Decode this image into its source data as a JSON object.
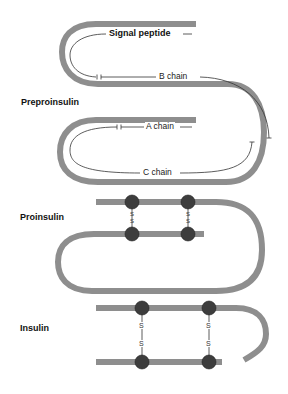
{
  "diagram": {
    "colors": {
      "chain": "#8c8c8c",
      "residue": "#3a3a3a",
      "annotation_line": "#333333",
      "text": "#111111"
    },
    "stages": [
      {
        "id": "preproinsulin",
        "label": "Preproinsulin",
        "segments": [
          {
            "id": "signal",
            "label": "Signal peptide"
          },
          {
            "id": "b_chain",
            "label": "B chain"
          },
          {
            "id": "a_chain",
            "label": "A chain"
          },
          {
            "id": "c_chain",
            "label": "C chain"
          }
        ]
      },
      {
        "id": "proinsulin",
        "label": "Proinsulin",
        "disulfide_bonds": [
          {
            "label": "S-S"
          },
          {
            "label": "S-S"
          }
        ]
      },
      {
        "id": "insulin",
        "label": "Insulin",
        "disulfide_bonds": [
          {
            "label": "S-S"
          },
          {
            "label": "S-S"
          }
        ]
      }
    ],
    "sulfur_symbol": "S"
  }
}
